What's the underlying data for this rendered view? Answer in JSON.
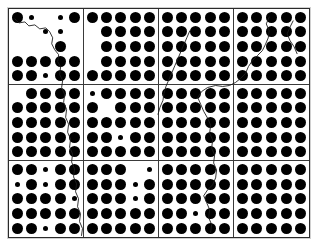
{
  "figure": {
    "kind": "dot-array-grid",
    "grid": {
      "columns": 4,
      "rows": 3
    },
    "cell_dot_grid": {
      "columns": 5,
      "rows": 5
    },
    "colors": {
      "background": "#ffffff",
      "dot": "#000000",
      "cell_border": "#3a3a3a",
      "plate_border": "#2b2b2b",
      "crack_line": "#1d1d1d"
    },
    "dot_sizes": {
      "L": "large",
      "S": "small",
      "N": "absent"
    }
  },
  "cells": [
    {
      "id": "cell-r1c1",
      "row": 1,
      "col": 1,
      "dots": [
        [
          "L",
          "S",
          "N",
          "S",
          "L"
        ],
        [
          "N",
          "N",
          "S",
          "S",
          "N"
        ],
        [
          "N",
          "N",
          "N",
          "L",
          "N"
        ],
        [
          "L",
          "L",
          "L",
          "L",
          "L"
        ],
        [
          "L",
          "L",
          "S",
          "L",
          "L"
        ]
      ]
    },
    {
      "id": "cell-r1c2",
      "row": 1,
      "col": 2,
      "dots": [
        [
          "L",
          "L",
          "L",
          "L",
          "L"
        ],
        [
          "N",
          "L",
          "L",
          "L",
          "L"
        ],
        [
          "N",
          "L",
          "L",
          "L",
          "L"
        ],
        [
          "N",
          "L",
          "L",
          "L",
          "L"
        ],
        [
          "L",
          "L",
          "L",
          "L",
          "L"
        ]
      ]
    },
    {
      "id": "cell-r1c3",
      "row": 1,
      "col": 3,
      "dots": [
        [
          "L",
          "L",
          "L",
          "L",
          "L"
        ],
        [
          "L",
          "L",
          "L",
          "L",
          "L"
        ],
        [
          "L",
          "L",
          "L",
          "L",
          "L"
        ],
        [
          "L",
          "L",
          "L",
          "L",
          "L"
        ],
        [
          "L",
          "L",
          "L",
          "L",
          "L"
        ]
      ]
    },
    {
      "id": "cell-r1c4",
      "row": 1,
      "col": 4,
      "dots": [
        [
          "L",
          "L",
          "L",
          "L",
          "L"
        ],
        [
          "L",
          "L",
          "L",
          "L",
          "L"
        ],
        [
          "L",
          "L",
          "L",
          "L",
          "L"
        ],
        [
          "L",
          "L",
          "L",
          "L",
          "L"
        ],
        [
          "L",
          "L",
          "L",
          "L",
          "L"
        ]
      ]
    },
    {
      "id": "cell-r2c1",
      "row": 2,
      "col": 1,
      "dots": [
        [
          "N",
          "L",
          "L",
          "L",
          "L"
        ],
        [
          "L",
          "L",
          "L",
          "L",
          "L"
        ],
        [
          "L",
          "L",
          "L",
          "L",
          "L"
        ],
        [
          "L",
          "L",
          "L",
          "L",
          "L"
        ],
        [
          "L",
          "L",
          "L",
          "L",
          "L"
        ]
      ]
    },
    {
      "id": "cell-r2c2",
      "row": 2,
      "col": 2,
      "dots": [
        [
          "S",
          "L",
          "L",
          "L",
          "L"
        ],
        [
          "L",
          "N",
          "L",
          "L",
          "L"
        ],
        [
          "L",
          "L",
          "L",
          "L",
          "L"
        ],
        [
          "L",
          "L",
          "S",
          "L",
          "L"
        ],
        [
          "L",
          "L",
          "L",
          "L",
          "L"
        ]
      ]
    },
    {
      "id": "cell-r2c3",
      "row": 2,
      "col": 3,
      "dots": [
        [
          "L",
          "L",
          "L",
          "L",
          "L"
        ],
        [
          "L",
          "L",
          "L",
          "L",
          "L"
        ],
        [
          "L",
          "L",
          "L",
          "L",
          "L"
        ],
        [
          "L",
          "L",
          "L",
          "L",
          "L"
        ],
        [
          "L",
          "L",
          "L",
          "L",
          "L"
        ]
      ]
    },
    {
      "id": "cell-r2c4",
      "row": 2,
      "col": 4,
      "dots": [
        [
          "L",
          "L",
          "L",
          "L",
          "L"
        ],
        [
          "L",
          "L",
          "L",
          "L",
          "L"
        ],
        [
          "L",
          "L",
          "L",
          "L",
          "L"
        ],
        [
          "L",
          "L",
          "L",
          "L",
          "L"
        ],
        [
          "L",
          "L",
          "L",
          "L",
          "L"
        ]
      ]
    },
    {
      "id": "cell-r3c1",
      "row": 3,
      "col": 1,
      "dots": [
        [
          "L",
          "L",
          "S",
          "L",
          "L"
        ],
        [
          "S",
          "L",
          "S",
          "L",
          "L"
        ],
        [
          "L",
          "L",
          "L",
          "L",
          "S"
        ],
        [
          "L",
          "L",
          "L",
          "L",
          "L"
        ],
        [
          "L",
          "L",
          "S",
          "L",
          "L"
        ]
      ]
    },
    {
      "id": "cell-r3c2",
      "row": 3,
      "col": 2,
      "dots": [
        [
          "L",
          "L",
          "L",
          "N",
          "S"
        ],
        [
          "L",
          "L",
          "L",
          "S",
          "L"
        ],
        [
          "L",
          "L",
          "L",
          "S",
          "L"
        ],
        [
          "L",
          "L",
          "L",
          "L",
          "L"
        ],
        [
          "L",
          "L",
          "L",
          "L",
          "L"
        ]
      ]
    },
    {
      "id": "cell-r3c3",
      "row": 3,
      "col": 3,
      "dots": [
        [
          "L",
          "L",
          "L",
          "L",
          "L"
        ],
        [
          "L",
          "L",
          "L",
          "L",
          "L"
        ],
        [
          "L",
          "L",
          "L",
          "L",
          "L"
        ],
        [
          "L",
          "L",
          "S",
          "L",
          "L"
        ],
        [
          "L",
          "L",
          "L",
          "L",
          "L"
        ]
      ]
    },
    {
      "id": "cell-r3c4",
      "row": 3,
      "col": 4,
      "dots": [
        [
          "L",
          "L",
          "L",
          "L",
          "L"
        ],
        [
          "L",
          "L",
          "L",
          "L",
          "L"
        ],
        [
          "L",
          "L",
          "L",
          "L",
          "L"
        ],
        [
          "L",
          "L",
          "L",
          "L",
          "L"
        ],
        [
          "L",
          "L",
          "L",
          "L",
          "L"
        ]
      ]
    }
  ],
  "cracks": [
    {
      "id": "crack-left",
      "path": "M 6 10 L 10 14 L 16 13 L 20 17 L 26 16 L 31 20 L 37 19 L 41 23 L 44 29 L 43 35 L 46 41 L 50 46 L 49 53 L 52 58 L 51 66 L 54 72 L 53 79 L 56 86 L 55 94 L 58 101 L 57 109 L 60 116 L 59 124 L 62 131 L 61 139 L 64 146 L 63 154 L 66 161 L 65 169 L 68 176 L 67 184 L 70 191 L 69 199 L 72 206 L 71 214 L 74 221 L 73 228"
    },
    {
      "id": "crack-right",
      "path": "M 262 8 L 259 15 L 262 22 L 261 29 L 258 36 L 255 42 L 250 47 L 245 52 L 241 58 L 238 65 L 233 70 L 228 74 L 222 77 L 215 78 L 208 77 L 200 79 L 194 83 L 190 89 L 193 96 L 196 103 L 200 110 L 203 117 L 202 125 L 205 132 L 204 140 L 207 147 L 206 155 L 209 162 L 208 170 L 205 177 L 200 182 L 196 188 L 199 195 L 202 202 L 201 210 L 204 217 L 203 225"
    },
    {
      "id": "crack-mid-upper",
      "path": "M 182 22 L 179 29 L 176 36 L 173 43 L 170 50 L 167 57 L 164 64 L 161 71 L 158 78 L 156 85 L 155 92 L 152 99 L 150 106"
    },
    {
      "id": "crack-short-right",
      "path": "M 286 12 L 283 18 L 280 25 L 283 32 L 287 38 L 290 45"
    }
  ]
}
